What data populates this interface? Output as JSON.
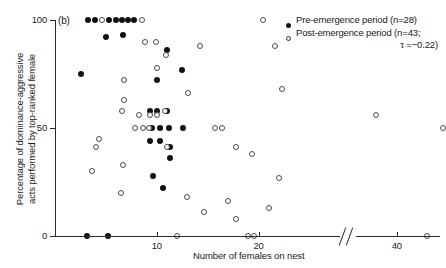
{
  "panel": {
    "label": "(b)"
  },
  "axes": {
    "ylabel_line1": "Percentage of dominance-aggressive",
    "ylabel_line2": "acts performed by top-ranked female",
    "xlabel": "Number of females on nest",
    "yticks": [
      "0",
      "50",
      "100"
    ],
    "ytick_values": [
      0,
      50,
      100
    ],
    "xticks": [
      "10",
      "20",
      "40"
    ],
    "xtick_values": [
      10,
      20,
      40
    ],
    "axis_break": true
  },
  "legend": {
    "pre_marker": "filled-circle-marker",
    "pre_label": "Pre-emergence period (n=28)",
    "post_marker": "open-circle-marker",
    "post_label": "Post-emergence period (n=43;",
    "tau_label": "τ =−0.22)"
  },
  "chart_data": {
    "type": "scatter",
    "title": "",
    "xlabel": "Number of females on nest",
    "ylabel": "Percentage of dominance-aggressive acts performed by top-ranked female",
    "xlim": [
      0,
      46
    ],
    "ylim": [
      0,
      100
    ],
    "x_axis_break": [
      22,
      36
    ],
    "grid": false,
    "legend_position": "top-right",
    "series": [
      {
        "name": "Pre-emergence period",
        "n": 28,
        "marker": "filled-circle",
        "color": "#111111",
        "points": [
          [
            3.2,
            100
          ],
          [
            3.9,
            100
          ],
          [
            5.3,
            100
          ],
          [
            6.0,
            100
          ],
          [
            6.6,
            100
          ],
          [
            7.2,
            100
          ],
          [
            7.8,
            100
          ],
          [
            5.0,
            92
          ],
          [
            6.7,
            93
          ],
          [
            11.0,
            86
          ],
          [
            2.6,
            75
          ],
          [
            12.5,
            77
          ],
          [
            10.0,
            72
          ],
          [
            9.3,
            58
          ],
          [
            10.0,
            58
          ],
          [
            11.0,
            58
          ],
          [
            9.5,
            50
          ],
          [
            10.3,
            50
          ],
          [
            11.2,
            50
          ],
          [
            12.6,
            50
          ],
          [
            9.3,
            44
          ],
          [
            10.3,
            44
          ],
          [
            11.3,
            41
          ],
          [
            11.3,
            36
          ],
          [
            9.6,
            28
          ],
          [
            10.6,
            22
          ],
          [
            3.1,
            0
          ],
          [
            5.2,
            0
          ]
        ]
      },
      {
        "name": "Post-emergence period",
        "n": 43,
        "tau": -0.22,
        "marker": "open-circle",
        "color": "#4a4a4a",
        "points": [
          [
            4.6,
            100
          ],
          [
            8.5,
            100
          ],
          [
            20.4,
            100
          ],
          [
            8.8,
            90
          ],
          [
            9.9,
            90
          ],
          [
            14.2,
            88
          ],
          [
            28.0,
            88
          ],
          [
            10.9,
            84
          ],
          [
            10.0,
            78
          ],
          [
            6.8,
            72
          ],
          [
            28.7,
            68
          ],
          [
            13.1,
            66
          ],
          [
            6.8,
            63
          ],
          [
            6.6,
            58
          ],
          [
            10.8,
            58
          ],
          [
            8.3,
            56
          ],
          [
            9.3,
            56
          ],
          [
            10.0,
            56
          ],
          [
            38.0,
            56
          ],
          [
            4.3,
            45
          ],
          [
            4.0,
            41
          ],
          [
            11.0,
            41
          ],
          [
            24.2,
            41
          ],
          [
            19.4,
            38
          ],
          [
            6.7,
            33
          ],
          [
            3.6,
            30
          ],
          [
            22.0,
            27
          ],
          [
            6.5,
            20
          ],
          [
            13.0,
            18
          ],
          [
            17.0,
            16
          ],
          [
            14.6,
            11
          ],
          [
            17.8,
            8
          ],
          [
            12.0,
            0
          ],
          [
            19.0,
            0
          ],
          [
            26.0,
            0
          ],
          [
            43.0,
            0
          ],
          [
            15.7,
            50
          ],
          [
            16.4,
            50
          ],
          [
            7.9,
            50
          ],
          [
            8.6,
            50
          ],
          [
            9.2,
            50
          ],
          [
            21.0,
            13
          ],
          [
            44.5,
            50
          ]
        ]
      }
    ]
  }
}
